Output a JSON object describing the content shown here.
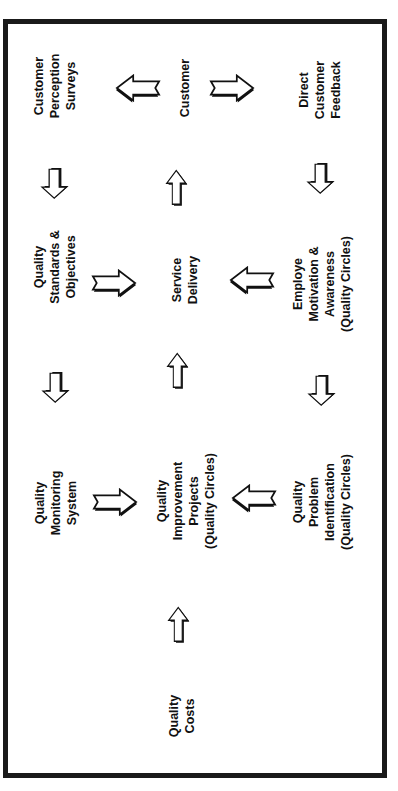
{
  "diagram": {
    "title": "",
    "orientation": "rotated-90-ccw",
    "nodes": {
      "customer_perception_surveys": [
        "Customer",
        "Perception",
        "Surveys"
      ],
      "customer": [
        "Customer"
      ],
      "direct_customer_feedback": [
        "Direct",
        "Customer",
        "Feedback"
      ],
      "quality_standards": [
        "Quality",
        "Standards &",
        "Objectives"
      ],
      "service_delivery": [
        "Service",
        "Delivery"
      ],
      "employe_motivation": [
        "Employe",
        "Motivation &",
        "Awareness",
        "(Quality Circles)"
      ],
      "quality_monitoring": [
        "Quality",
        "Monitoring",
        "System"
      ],
      "quality_improvement": [
        "Quality",
        "Improvement",
        "Projects",
        "(Quality Circles)"
      ],
      "quality_problem": [
        "Quality",
        "Problem",
        "Identification",
        "(Quality Circles)"
      ],
      "quality_costs": [
        "Quality",
        "Costs"
      ]
    },
    "edges": [
      {
        "from": "customer",
        "to": "customer_perception_surveys"
      },
      {
        "from": "customer",
        "to": "direct_customer_feedback"
      },
      {
        "from": "customer_perception_surveys",
        "to": "quality_standards"
      },
      {
        "from": "service_delivery",
        "to": "customer"
      },
      {
        "from": "direct_customer_feedback",
        "to": "employe_motivation"
      },
      {
        "from": "quality_standards",
        "to": "service_delivery"
      },
      {
        "from": "employe_motivation",
        "to": "service_delivery"
      },
      {
        "from": "quality_standards",
        "to": "quality_monitoring"
      },
      {
        "from": "quality_improvement",
        "to": "service_delivery"
      },
      {
        "from": "employe_motivation",
        "to": "quality_problem"
      },
      {
        "from": "quality_monitoring",
        "to": "quality_improvement"
      },
      {
        "from": "quality_problem",
        "to": "quality_improvement"
      },
      {
        "from": "quality_costs",
        "to": "quality_improvement"
      }
    ],
    "colors": {
      "ink": "#111111",
      "frame": "#1a1a1a",
      "background": "#ffffff"
    }
  }
}
